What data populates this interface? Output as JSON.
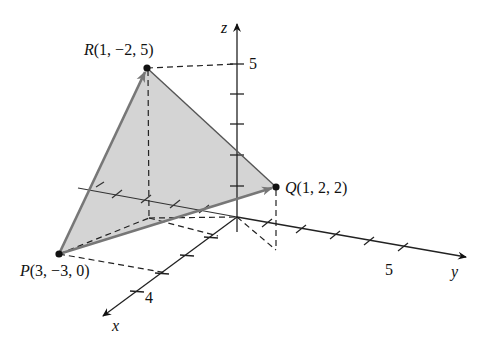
{
  "diagram": {
    "type": "3d-coordinate-triangle",
    "points": {
      "P": {
        "name": "P",
        "coords": "(3, −3, 0)",
        "label": "(3, −3, 0)"
      },
      "Q": {
        "name": "Q",
        "coords": "(1, 2, 2)",
        "label": "(1, 2, 2)"
      },
      "R": {
        "name": "R",
        "coords": "(1, −2, 5)",
        "label": "(1, −2, 5)"
      }
    },
    "axes": {
      "x": {
        "label": "x",
        "tick_label": "4"
      },
      "y": {
        "label": "y",
        "tick_label": "5"
      },
      "z": {
        "label": "z",
        "tick_label": "5"
      }
    },
    "colors": {
      "triangle_fill": "#d4d4d4",
      "edge": "#6e6e6e",
      "axis": "#222222"
    }
  }
}
